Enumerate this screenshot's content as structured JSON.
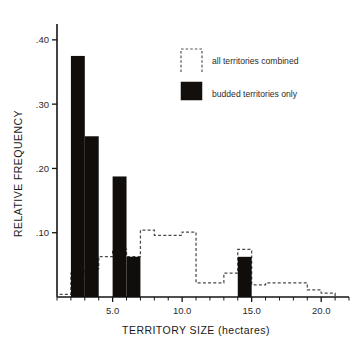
{
  "chart_data": {
    "type": "bar",
    "title": "",
    "subtitle": "",
    "xlabel": "TERRITORY SIZE (hectares)",
    "ylabel": "RELATIVE FREQUENCY",
    "xlim": [
      1,
      22
    ],
    "ylim": [
      0,
      0.42
    ],
    "x_tick_labels": [
      "5.0",
      "10.0",
      "15.0",
      "20.0"
    ],
    "x_tick_values": [
      5.0,
      10.0,
      15.0,
      20.0
    ],
    "x_minor_tick_step": 1.0,
    "y_tick_labels": [
      ".10",
      ".20",
      ".30",
      ".40"
    ],
    "y_tick_values": [
      0.1,
      0.2,
      0.3,
      0.4
    ],
    "grid": false,
    "legend_position": "upper right",
    "bin_width": 1.0,
    "series": [
      {
        "name": "budded territories only",
        "style": "filled-bars",
        "color": "#100d0b",
        "bins": [
          {
            "x0": 2,
            "x1": 3,
            "value": 0.375
          },
          {
            "x0": 3,
            "x1": 4,
            "value": 0.25
          },
          {
            "x0": 4,
            "x1": 5,
            "value": 0.0
          },
          {
            "x0": 5,
            "x1": 6,
            "value": 0.1875
          },
          {
            "x0": 6,
            "x1": 7,
            "value": 0.0625
          },
          {
            "x0": 14,
            "x1": 15,
            "value": 0.0625
          }
        ]
      },
      {
        "name": "all territories combined",
        "style": "dashed-step-outline",
        "color": "#4a4a4a",
        "bins": [
          {
            "x0": 1,
            "x1": 2,
            "value": 0.004
          },
          {
            "x0": 2,
            "x1": 3,
            "value": 0.037
          },
          {
            "x0": 3,
            "x1": 4,
            "value": 0.044
          },
          {
            "x0": 4,
            "x1": 5,
            "value": 0.063
          },
          {
            "x0": 5,
            "x1": 6,
            "value": 0.074
          },
          {
            "x0": 6,
            "x1": 7,
            "value": 0.063
          },
          {
            "x0": 7,
            "x1": 8,
            "value": 0.104
          },
          {
            "x0": 8,
            "x1": 9,
            "value": 0.096
          },
          {
            "x0": 9,
            "x1": 10,
            "value": 0.096
          },
          {
            "x0": 10,
            "x1": 11,
            "value": 0.101
          },
          {
            "x0": 11,
            "x1": 12,
            "value": 0.022
          },
          {
            "x0": 12,
            "x1": 13,
            "value": 0.022
          },
          {
            "x0": 13,
            "x1": 14,
            "value": 0.037
          },
          {
            "x0": 14,
            "x1": 15,
            "value": 0.074
          },
          {
            "x0": 15,
            "x1": 16,
            "value": 0.019
          },
          {
            "x0": 16,
            "x1": 19,
            "value": 0.022
          },
          {
            "x0": 19,
            "x1": 20,
            "value": 0.011
          },
          {
            "x0": 20,
            "x1": 21,
            "value": 0.006
          }
        ]
      }
    ]
  },
  "legend": {
    "entries": [
      {
        "label": "all territories combined",
        "swatch": "dashed-open-box"
      },
      {
        "label": "budded territories only",
        "swatch": "solid-black-square"
      }
    ]
  }
}
